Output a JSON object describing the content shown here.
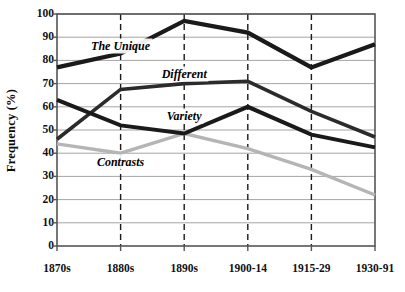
{
  "chart_data": {
    "type": "line",
    "title": "",
    "xlabel": "",
    "ylabel": "Frequency (%)",
    "categories": [
      "1870s",
      "1880s",
      "1890s",
      "1900-14",
      "1915-29",
      "1930-91"
    ],
    "ylim": [
      0,
      100
    ],
    "ytick_step": 10,
    "yticks": [
      0,
      10,
      20,
      30,
      40,
      50,
      60,
      70,
      80,
      90,
      100
    ],
    "grid": "horizontal-solid-gray, vertical-dashed-black",
    "legend": "inline-labels",
    "series": [
      {
        "name": "The Unique",
        "color": "#1a1a1a",
        "width": 4.2,
        "values": [
          77,
          83,
          97,
          92,
          77,
          87
        ],
        "label_x": "1880s",
        "label_y": 86
      },
      {
        "name": "Different",
        "color": "#2b2b2b",
        "width": 3.6,
        "values": [
          46,
          67.5,
          70,
          71,
          58,
          47
        ],
        "label_x": "1890s",
        "label_y": 74
      },
      {
        "name": "Variety",
        "color": "#1a1a1a",
        "width": 4.0,
        "values": [
          63,
          52,
          48.5,
          60,
          48,
          42.5
        ],
        "label_x": "1890s",
        "label_y": 56
      },
      {
        "name": "Contrasts",
        "color": "#b5b5b5",
        "width": 3.4,
        "values": [
          44,
          40,
          48.5,
          42,
          33,
          22
        ],
        "label_x": "1880s",
        "label_y": 36
      }
    ]
  },
  "axes": {
    "y_title": "Frequency (%)",
    "y_tick_labels": [
      "100",
      "90",
      "80",
      "70",
      "60",
      "50",
      "40",
      "30",
      "20",
      "10",
      "0"
    ],
    "x_tick_labels": [
      "1870s",
      "1880s",
      "1890s",
      "1900-14",
      "1915-29",
      "1930-91"
    ]
  },
  "series_labels": {
    "unique": "The Unique",
    "different": "Different",
    "variety": "Variety",
    "contrasts": "Contrasts"
  },
  "colors": {
    "frame": "#555555",
    "gridline": "#9a9a9a",
    "vertical_dashed": "#1a1a1a",
    "dark_series": "#1a1a1a",
    "mid_series": "#2b2b2b",
    "gray_series": "#b5b5b5",
    "background": "#ffffff",
    "text": "#111111"
  }
}
